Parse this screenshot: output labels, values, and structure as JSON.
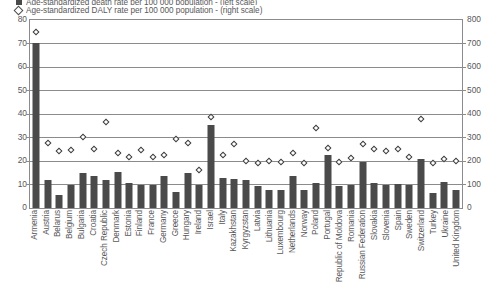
{
  "legend": {
    "clipped_top": {
      "label": "Age-standardized death rate per 100 000 population - (left scale)",
      "marker": "bar-swatch-icon"
    },
    "visible": {
      "label": "Age-standardized DALY rate per 100 000 population - (right scale)",
      "marker": "diamond-marker-icon"
    }
  },
  "axis": {
    "left_ticks": [
      "80",
      "70",
      "60",
      "50",
      "40",
      "30",
      "20",
      "10",
      "0"
    ],
    "right_ticks": [
      "800",
      "700",
      "600",
      "500",
      "400",
      "300",
      "200",
      "100",
      "0"
    ],
    "left_title": "",
    "right_title": ""
  },
  "colors": {
    "bar": "#4a4a4a",
    "marker_edge": "#3c3c3c",
    "marker_fill": "#ffffff",
    "grid": "#8b8b8d",
    "text": "#58585a"
  },
  "chart_data": {
    "type": "bar",
    "title": "",
    "subtitle": "",
    "xlabel": "",
    "ylabel": "Age-standardized death rate per 100 000 population",
    "y2label": "Age-standardized DALY rate per 100 000 population",
    "ylim": [
      0,
      80
    ],
    "y2lim": [
      0,
      800
    ],
    "grid": true,
    "legend_position": "top",
    "categories": [
      "Armenia",
      "Austria",
      "Belarus",
      "Belgium",
      "Bulgaria",
      "Croatia",
      "Czech Republic",
      "Denmark",
      "Estonia",
      "Finland",
      "France",
      "Germany",
      "Greece",
      "Hungary",
      "Ireland",
      "Israel",
      "Italy",
      "Kazakhstan",
      "Kyrgyzstan",
      "Latvia",
      "Lithuania",
      "Luxembourg",
      "Netherlands",
      "Norway",
      "Poland",
      "Portugal",
      "Republic of Moldova",
      "Romania",
      "Russian Federation",
      "Slovakia",
      "Slovenia",
      "Spain",
      "Sweden",
      "Switzerland",
      "Turkey",
      "Ukraine",
      "United Kingdom"
    ],
    "series": [
      {
        "name": "Age-standardized death rate per 100 000 population - (left scale)",
        "type": "bar",
        "axis": "left",
        "values": [
          70,
          11.5,
          5.5,
          9.5,
          14.5,
          13.5,
          11.5,
          15,
          10.5,
          9.5,
          9.5,
          13.5,
          6.5,
          14.5,
          9.5,
          35,
          12.5,
          12,
          11.5,
          9,
          7.5,
          7.5,
          13.5,
          7.5,
          10.5,
          22.5,
          9,
          9.5,
          19.5,
          10.5,
          9.5,
          10,
          9.5,
          20.5,
          6,
          11,
          7.5
        ]
      },
      {
        "name": "Age-standardized DALY rate per 100 000 population - (right scale)",
        "type": "scatter",
        "axis": "right",
        "values": [
          745,
          275,
          240,
          245,
          300,
          250,
          365,
          230,
          215,
          245,
          215,
          225,
          290,
          275,
          160,
          385,
          225,
          270,
          200,
          190,
          200,
          195,
          230,
          190,
          340,
          255,
          195,
          210,
          270,
          250,
          240,
          250,
          215,
          375,
          190,
          205,
          200
        ]
      }
    ]
  }
}
